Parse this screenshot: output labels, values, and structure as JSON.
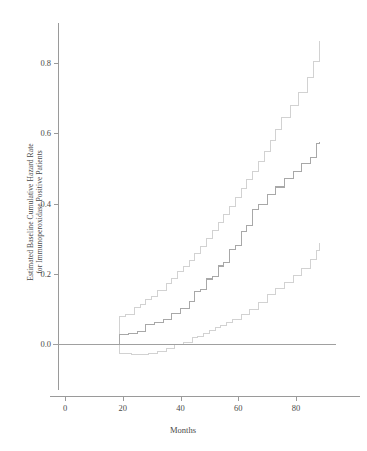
{
  "figure": {
    "kind": "statistical-step-plot",
    "background_color": "#ffffff"
  },
  "axes": {
    "x_title": "Months",
    "y_title_line1": "Estimated Baseline Cumulative Hazard Rate",
    "y_title_line2": "for Immunoperoxidase Positive Patients",
    "x_ticks": [
      "0",
      "20",
      "40",
      "60",
      "80"
    ],
    "y_ticks": [
      "0.0",
      "0.2",
      "0.4",
      "0.6",
      "0.8"
    ],
    "axis_color": "#9a9a9a",
    "tick_text_color": "#4a4a4a"
  },
  "chart_data": {
    "type": "line",
    "title": "",
    "subtitle": "",
    "xlabel": "Months",
    "ylabel": "Estimated Baseline Cumulative Hazard Rate for Immunoperoxidase Positive Patients",
    "xlim": [
      -4,
      94
    ],
    "ylim": [
      -0.07,
      0.93
    ],
    "xticks": [
      0,
      20,
      40,
      60,
      80
    ],
    "yticks": [
      0.0,
      0.2,
      0.4,
      0.6,
      0.8
    ],
    "grid": false,
    "legend": "none",
    "interpolation": "step-after",
    "annotations": [
      "Horizontal reference line drawn at cumulative hazard = 0.0 spanning the full x-range",
      "Curves are step functions beginning near month 19 and ending near month 88",
      "Outer pair of lighter curves are pointwise confidence bounds around the darker central estimate"
    ],
    "series": [
      {
        "name": "Upper confidence bound",
        "color": "#d2d2d2",
        "style": "step",
        "x": [
          19,
          19,
          21,
          24,
          26,
          28,
          30,
          32,
          35,
          37,
          39,
          41,
          43,
          45,
          47,
          49,
          51,
          53,
          55,
          57,
          59,
          61,
          63,
          65,
          67,
          69,
          71,
          73,
          75,
          78,
          81,
          84,
          86,
          88
        ],
        "y": [
          0.0,
          0.078,
          0.085,
          0.105,
          0.112,
          0.128,
          0.136,
          0.152,
          0.173,
          0.186,
          0.205,
          0.222,
          0.239,
          0.258,
          0.278,
          0.3,
          0.323,
          0.345,
          0.368,
          0.392,
          0.418,
          0.443,
          0.468,
          0.492,
          0.52,
          0.548,
          0.578,
          0.61,
          0.645,
          0.678,
          0.716,
          0.758,
          0.805,
          0.862
        ]
      },
      {
        "name": "Estimated baseline cumulative hazard",
        "color": "#a8a8a8",
        "style": "step",
        "x": [
          19,
          19,
          22,
          25,
          28,
          31,
          34,
          37,
          40,
          43,
          45,
          47,
          49,
          51,
          53,
          55,
          57,
          59,
          61,
          63,
          65,
          67,
          70,
          73,
          76,
          79,
          82,
          85,
          87,
          88
        ],
        "y": [
          0.0,
          0.028,
          0.031,
          0.035,
          0.056,
          0.062,
          0.07,
          0.086,
          0.1,
          0.12,
          0.15,
          0.156,
          0.185,
          0.192,
          0.222,
          0.232,
          0.268,
          0.28,
          0.32,
          0.338,
          0.382,
          0.398,
          0.425,
          0.447,
          0.47,
          0.492,
          0.515,
          0.53,
          0.57,
          0.575
        ]
      },
      {
        "name": "Lower confidence bound",
        "color": "#d2d2d2",
        "style": "step",
        "x": [
          19,
          19,
          23,
          26,
          29,
          32,
          35,
          38,
          41,
          44,
          46,
          48,
          50,
          52,
          54,
          56,
          58,
          61,
          64,
          67,
          70,
          73,
          76,
          79,
          82,
          85,
          87,
          88
        ],
        "y": [
          0.0,
          -0.028,
          -0.03,
          -0.03,
          -0.028,
          -0.02,
          -0.014,
          -0.002,
          0.003,
          0.018,
          0.022,
          0.03,
          0.038,
          0.048,
          0.052,
          0.06,
          0.07,
          0.085,
          0.098,
          0.118,
          0.14,
          0.158,
          0.176,
          0.196,
          0.215,
          0.24,
          0.265,
          0.287
        ]
      },
      {
        "name": "Zero reference line",
        "color": "#a0a0a0",
        "style": "horizontal-line",
        "x": [
          -4,
          94
        ],
        "y": [
          0.0,
          0.0
        ]
      }
    ]
  }
}
